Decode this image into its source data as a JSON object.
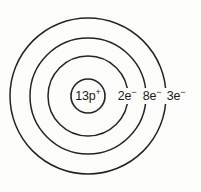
{
  "diagram": {
    "type": "bohr-atomic-model",
    "background_color": "#fdfdfc",
    "stroke_color": "#232323",
    "center": {
      "x": 88,
      "y": 96
    },
    "nucleus": {
      "radius": 17,
      "protons": "13",
      "particle_symbol": "p",
      "charge_sign": "+",
      "label": "13p+"
    },
    "shells": [
      {
        "name": "shell-1",
        "radius": 40,
        "electrons": "2",
        "particle_symbol": "e",
        "charge_sign": "−",
        "label": "2e−",
        "label_x": 127,
        "label_y": 100
      },
      {
        "name": "shell-2",
        "radius": 58,
        "electrons": "8",
        "particle_symbol": "e",
        "charge_sign": "−",
        "label": "8e−",
        "label_x": 152,
        "label_y": 100
      },
      {
        "name": "shell-3",
        "radius": 78,
        "electrons": "3",
        "particle_symbol": "e",
        "charge_sign": "−",
        "label": "3e−",
        "label_x": 176,
        "label_y": 100
      }
    ]
  }
}
